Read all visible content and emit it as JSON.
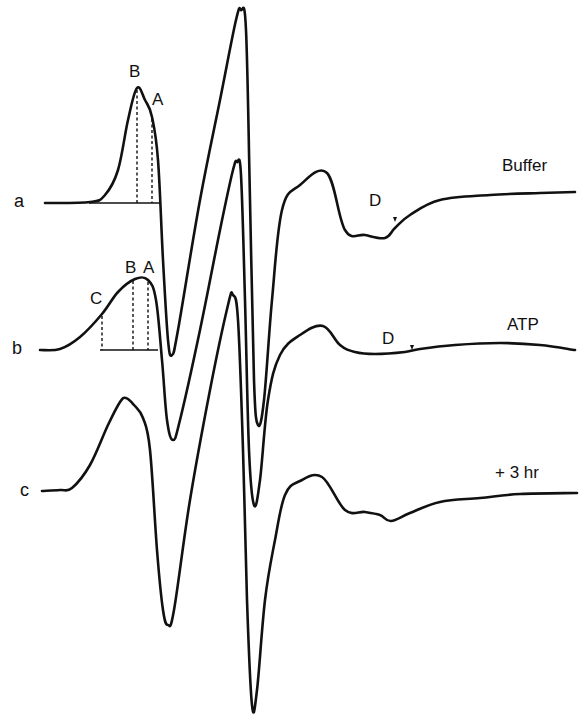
{
  "figure": {
    "rows": [
      {
        "id": "a",
        "label": "a",
        "condition": "Buffer",
        "peak_labels": [
          "B",
          "A"
        ],
        "feature_label": "D"
      },
      {
        "id": "b",
        "label": "b",
        "condition": "ATP",
        "peak_labels": [
          "C",
          "B",
          "A"
        ],
        "feature_label": "D"
      },
      {
        "id": "c",
        "label": "c",
        "condition": "+ 3 hr"
      }
    ],
    "markers": {
      "d_arrow": "▾"
    }
  },
  "chart_data": {
    "type": "line",
    "title": "",
    "xlabel": "",
    "ylabel": "",
    "grid": false,
    "legend": "inline labels at right end of each trace",
    "note": "Three stacked derivative (EPR-style) spectra, offset vertically; coordinates are in image pixel space (x rightward, y downward).",
    "series": [
      {
        "name": "Buffer",
        "row": "a",
        "points": [
          [
            45,
            203
          ],
          [
            90,
            202
          ],
          [
            105,
            195
          ],
          [
            118,
            170
          ],
          [
            128,
            120
          ],
          [
            137,
            88
          ],
          [
            145,
            100
          ],
          [
            152,
            117
          ],
          [
            158,
            160
          ],
          [
            163,
            260
          ],
          [
            168,
            340
          ],
          [
            172,
            355
          ],
          [
            178,
            330
          ],
          [
            200,
            200
          ],
          [
            220,
            100
          ],
          [
            236,
            20
          ],
          [
            241,
            10
          ],
          [
            246,
            30
          ],
          [
            250,
            200
          ],
          [
            254,
            380
          ],
          [
            258,
            425
          ],
          [
            264,
            400
          ],
          [
            272,
            300
          ],
          [
            282,
            210
          ],
          [
            300,
            185
          ],
          [
            327,
            173
          ],
          [
            345,
            230
          ],
          [
            365,
            235
          ],
          [
            385,
            238
          ],
          [
            395,
            228
          ],
          [
            410,
            215
          ],
          [
            440,
            200
          ],
          [
            490,
            195
          ],
          [
            540,
            193
          ],
          [
            575,
            192
          ]
        ],
        "annotations": [
          {
            "text": "B",
            "x": 137,
            "y": 88,
            "dropline_to_baseline": true
          },
          {
            "text": "A",
            "x": 152,
            "y": 117,
            "dropline_to_baseline": true
          },
          {
            "text": "D",
            "x": 395,
            "y": 228,
            "arrow": true
          }
        ]
      },
      {
        "name": "ATP",
        "row": "b",
        "points": [
          [
            40,
            350
          ],
          [
            60,
            349
          ],
          [
            80,
            337
          ],
          [
            102,
            314
          ],
          [
            118,
            292
          ],
          [
            135,
            279
          ],
          [
            148,
            280
          ],
          [
            156,
            300
          ],
          [
            162,
            360
          ],
          [
            167,
            420
          ],
          [
            173,
            440
          ],
          [
            180,
            420
          ],
          [
            200,
            330
          ],
          [
            220,
            230
          ],
          [
            233,
            170
          ],
          [
            237,
            162
          ],
          [
            241,
            175
          ],
          [
            245,
            300
          ],
          [
            249,
            450
          ],
          [
            254,
            505
          ],
          [
            260,
            480
          ],
          [
            268,
            400
          ],
          [
            280,
            355
          ],
          [
            300,
            335
          ],
          [
            323,
            326
          ],
          [
            340,
            345
          ],
          [
            355,
            352
          ],
          [
            375,
            354
          ],
          [
            405,
            352
          ],
          [
            420,
            349
          ],
          [
            455,
            345
          ],
          [
            500,
            343
          ],
          [
            540,
            345
          ],
          [
            575,
            350
          ]
        ],
        "annotations": [
          {
            "text": "C",
            "x": 102,
            "y": 314,
            "dropline_to_baseline": true
          },
          {
            "text": "B",
            "x": 133,
            "y": 279,
            "dropline_to_baseline": true
          },
          {
            "text": "A",
            "x": 148,
            "y": 280,
            "dropline_to_baseline": true
          },
          {
            "text": "D",
            "x": 412,
            "y": 352,
            "arrow": true
          }
        ]
      },
      {
        "name": "+ 3 hr",
        "row": "c",
        "points": [
          [
            42,
            491
          ],
          [
            60,
            490
          ],
          [
            72,
            488
          ],
          [
            90,
            465
          ],
          [
            108,
            425
          ],
          [
            120,
            402
          ],
          [
            126,
            398
          ],
          [
            134,
            405
          ],
          [
            143,
            418
          ],
          [
            150,
            450
          ],
          [
            157,
            550
          ],
          [
            163,
            610
          ],
          [
            168,
            625
          ],
          [
            174,
            610
          ],
          [
            190,
            500
          ],
          [
            210,
            390
          ],
          [
            228,
            305
          ],
          [
            233,
            295
          ],
          [
            238,
            320
          ],
          [
            243,
            450
          ],
          [
            247,
            600
          ],
          [
            252,
            705
          ],
          [
            257,
            690
          ],
          [
            265,
            600
          ],
          [
            275,
            540
          ],
          [
            285,
            495
          ],
          [
            300,
            481
          ],
          [
            322,
            477
          ],
          [
            345,
            510
          ],
          [
            365,
            512
          ],
          [
            380,
            515
          ],
          [
            391,
            521
          ],
          [
            410,
            513
          ],
          [
            440,
            502
          ],
          [
            480,
            498
          ],
          [
            520,
            494
          ],
          [
            577,
            493
          ]
        ]
      }
    ]
  }
}
